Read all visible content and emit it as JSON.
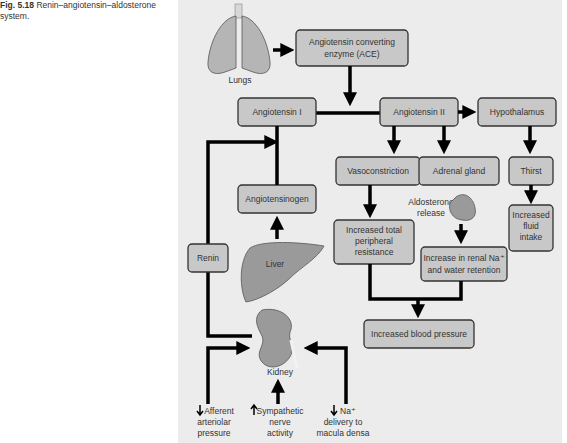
{
  "caption": {
    "label": "Fig. 5.18",
    "title": "Renin–angiotensin–aldosterone system."
  },
  "organs": {
    "lungs": "Lungs",
    "liver": "Liver",
    "kidney": "Kidney",
    "aldosterone": "Aldosterone",
    "aldosterone2": "release"
  },
  "boxes": {
    "ace1": "Angiotensin converting",
    "ace2": "enzyme (ACE)",
    "ang1": "Angiotensin I",
    "ang2": "Angiotensin II",
    "hypothalamus": "Hypothalamus",
    "angiotensinogen": "Angiotensinogen",
    "vasoconstriction": "Vasoconstriction",
    "adrenal": "Adrenal gland",
    "thirst": "Thirst",
    "fluid1": "Increased",
    "fluid2": "fluid",
    "fluid3": "intake",
    "tpr1": "Increased total",
    "tpr2": "peripheral",
    "tpr3": "resistance",
    "renal1": "Increase in renal Na⁺",
    "renal2": "and water retention",
    "renin": "Renin",
    "bp": "Increased blood pressure"
  },
  "stimuli": {
    "afferent1": "Afferent",
    "afferent2": "arteriolar",
    "afferent3": "pressure",
    "symp1": "Sympathetic",
    "symp2": "nerve",
    "symp3": "activity",
    "na1": "Na⁺",
    "na2": "delivery to",
    "na3": "macula densa"
  }
}
